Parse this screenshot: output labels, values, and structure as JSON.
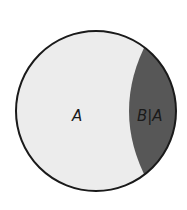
{
  "diagram": {
    "type": "venn",
    "colors": {
      "outer_fill": "#ececec",
      "inner_fill": "#575757",
      "stroke": "#1a1a1a",
      "background": "#ffffff"
    },
    "regions": [
      {
        "id": "A",
        "label": "A"
      },
      {
        "id": "B_given_A",
        "label": "B|A"
      }
    ]
  }
}
